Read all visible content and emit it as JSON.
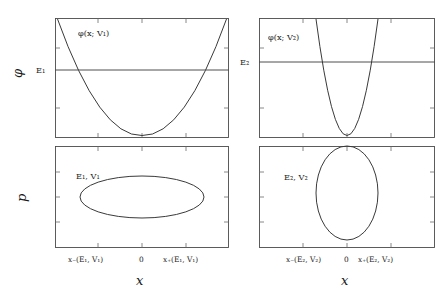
{
  "figure": {
    "panels": {
      "top_left": {
        "curve_label": "φ(x; V₁)",
        "energy_label": "E₁",
        "potential": "V₁",
        "curve_type": "parabola-wide",
        "energy_level_frac": 0.52,
        "turning_points_frac": [
          0.205,
          0.8
        ]
      },
      "top_right": {
        "curve_label": "φ(x; V₂)",
        "energy_label": "E₂",
        "potential": "V₂",
        "curve_type": "parabola-narrow",
        "energy_level_frac": 0.4,
        "turning_points_frac": [
          0.395,
          0.695
        ]
      },
      "bottom_left": {
        "orbit_label": "E₁, V₁",
        "orbit_type": "ellipse-wide",
        "orbit_center_frac": [
          0.5,
          0.5
        ],
        "orbit_radii_frac": [
          0.36,
          0.205
        ]
      },
      "bottom_right": {
        "orbit_label": "E₂, V₂",
        "orbit_type": "ellipse-tall",
        "orbit_center_frac": [
          0.5,
          0.46
        ],
        "orbit_radii_frac": [
          0.175,
          0.46
        ]
      }
    },
    "axes": {
      "y_top": "φ",
      "y_bottom": "p",
      "x_label": "x"
    },
    "ticks": {
      "bottom_left": [
        "x₋(E₁, V₁)",
        "0",
        "x₊(E₁, V₁)"
      ],
      "bottom_right": [
        "x₋(E₂, V₂)",
        "0",
        "x₊(E₂, V₂)"
      ]
    },
    "colors": {
      "curve": "#3a3a3a",
      "frame": "#4a4a4a",
      "background": "#ffffff"
    }
  }
}
